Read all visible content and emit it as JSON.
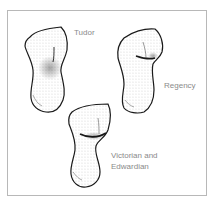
{
  "figure": {
    "title": "",
    "frame_color": "#b8b8b8",
    "label_color": "#8a8a8a",
    "ink_color": "#1a1a1a"
  },
  "torsos": [
    {
      "id": "tudor",
      "label": "Tudor",
      "lines": [
        "Tudor"
      ]
    },
    {
      "id": "regency",
      "label": "Regency",
      "lines": [
        "Regency"
      ]
    },
    {
      "id": "victorian-edwardian",
      "label": "Victorian and Edwardian",
      "lines": [
        "Victorian and",
        "Edwardian"
      ]
    }
  ]
}
